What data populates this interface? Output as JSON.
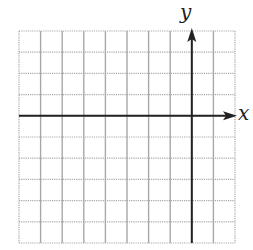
{
  "chart_data": {
    "type": "grid",
    "title": "",
    "xlabel": "x",
    "ylabel": "y",
    "columns": 10,
    "rows": 10,
    "y_axis_column_index": 8,
    "x_axis_row_index": 4,
    "grid_on": true
  },
  "labels": {
    "x": "x",
    "y": "y"
  },
  "colors": {
    "grid": "#a8a8a8",
    "axis": "#222222",
    "background": "#ffffff"
  }
}
